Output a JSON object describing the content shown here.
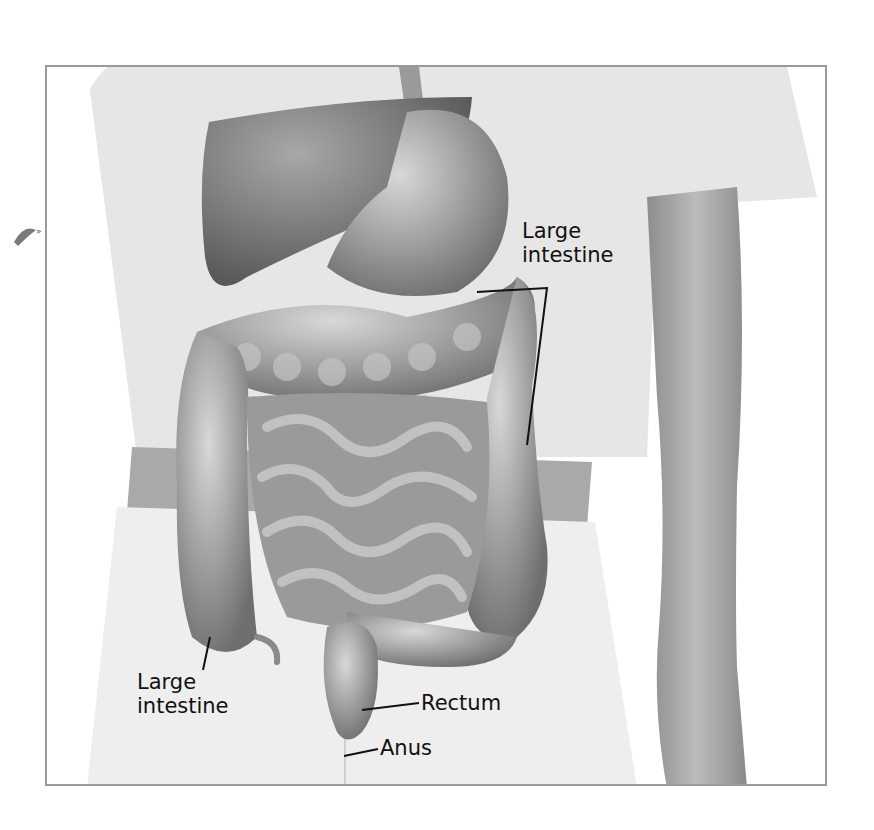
{
  "figure": {
    "labels": {
      "large_intestine_top": [
        "Large",
        "intestine"
      ],
      "large_intestine_bottom": [
        "Large",
        "intestine"
      ],
      "rectum": "Rectum",
      "anus": "Anus"
    },
    "colors": {
      "frame": "#9a9a9a",
      "shirt": "#e4e4e4",
      "skin": "#bdbdbd",
      "organ": "#9c9c9c",
      "organ_dark": "#6f6f6f",
      "leader_line": "#111111"
    }
  }
}
